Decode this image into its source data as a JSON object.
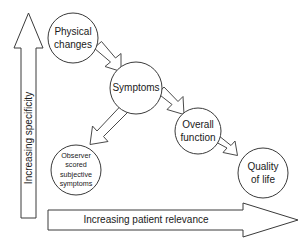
{
  "diagram": {
    "nodes": {
      "physical_changes": {
        "label": "Physical changes",
        "lines": [
          "Physical",
          "changes"
        ],
        "cx": 73,
        "cy": 38,
        "r": 25,
        "text_size": "medium"
      },
      "symptoms": {
        "label": "Symptoms",
        "lines": [
          "Symptoms"
        ],
        "cx": 136,
        "cy": 88,
        "r": 26,
        "text_size": "medium"
      },
      "observer_scored": {
        "label": "Observer scored subjective symptoms",
        "lines": [
          "Observer",
          "scored",
          "subjective",
          "symptoms"
        ],
        "cx": 76,
        "cy": 170,
        "r": 25,
        "text_size": "small"
      },
      "overall_function": {
        "label": "Overall function",
        "lines": [
          "Overall",
          "function"
        ],
        "cx": 198,
        "cy": 131,
        "r": 23,
        "text_size": "medium"
      },
      "quality_of_life": {
        "label": "Quality of life",
        "lines": [
          "Quality",
          "of life"
        ],
        "cx": 263,
        "cy": 173,
        "r": 25,
        "text_size": "medium"
      }
    },
    "connectors": [
      {
        "name": "physical-changes-to-symptoms",
        "from": "physical_changes",
        "to": "symptoms"
      },
      {
        "name": "symptoms-to-observer-scored",
        "from": "symptoms",
        "to": "observer_scored"
      },
      {
        "name": "symptoms-to-overall-function",
        "from": "symptoms",
        "to": "overall_function"
      },
      {
        "name": "overall-function-to-quality-of-life",
        "from": "overall_function",
        "to": "quality_of_life"
      }
    ],
    "axes": {
      "vertical": {
        "label": "Increasing specificity",
        "direction": "up"
      },
      "horizontal": {
        "label": "Increasing patient relevance",
        "direction": "right"
      }
    },
    "colors": {
      "background": "#ffffff",
      "stroke": "#3a3a3a",
      "arrow_stroke": "#4a4a4a",
      "text": "#1a1a1a"
    }
  }
}
